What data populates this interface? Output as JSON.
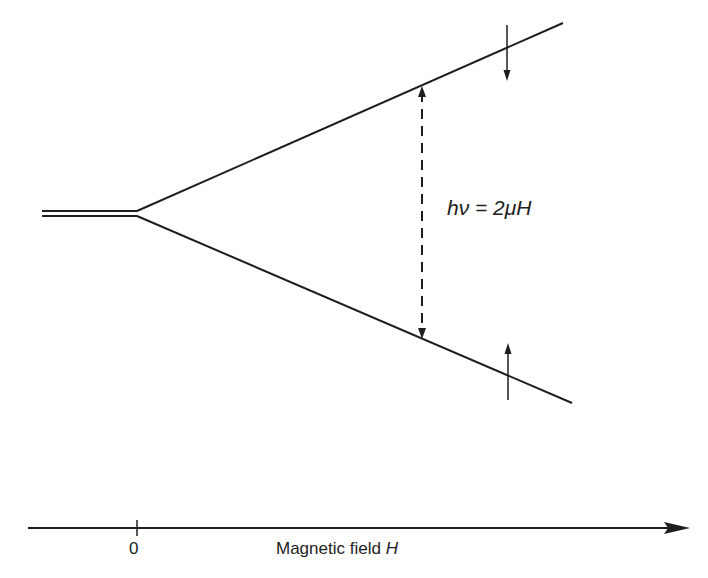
{
  "diagram": {
    "type": "zeeman-splitting-energy-levels",
    "formula_label": "hν = 2μH",
    "axis": {
      "origin_label": "0",
      "label_text": "Magnetic field ",
      "label_symbol": "H"
    },
    "elements": {
      "degenerate_level": "double line at H=0",
      "upper_level": "energy increasing with H",
      "lower_level": "energy decreasing with H",
      "transition": "dashed double-headed arrow between levels",
      "upper_spin": "down arrow",
      "lower_spin": "up arrow"
    },
    "colors": {
      "line": "#1e1e1e",
      "background": "#ffffff"
    }
  }
}
